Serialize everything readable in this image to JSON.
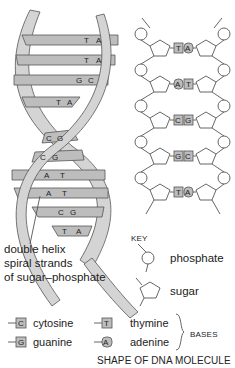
{
  "diagram": {
    "title": "SHAPE OF DNA MOLECULE",
    "helix": {
      "caption_lines": [
        "double helix",
        "spiral strands",
        "of sugar–phosphate"
      ],
      "pairs": [
        {
          "left": "T",
          "right": "A"
        },
        {
          "left": "T",
          "right": "A"
        },
        {
          "left": "G",
          "right": "C"
        },
        {
          "left": "T",
          "right": "A"
        },
        {
          "left": "C",
          "right": "G"
        },
        {
          "left": "C",
          "right": "G"
        },
        {
          "left": "A",
          "right": "T"
        },
        {
          "left": "A",
          "right": "T"
        },
        {
          "left": "C",
          "right": "G"
        },
        {
          "left": "T",
          "right": "A"
        }
      ]
    },
    "ladder": {
      "pairs": [
        {
          "left": "T",
          "right": "A"
        },
        {
          "left": "A",
          "right": "T"
        },
        {
          "left": "C",
          "right": "G"
        },
        {
          "left": "G",
          "right": "C"
        },
        {
          "left": "T",
          "right": "A"
        }
      ]
    },
    "key": {
      "heading": "KEY",
      "phosphate": "phosphate",
      "sugar": "sugar",
      "bases_label": "BASES",
      "bases": [
        {
          "letter": "C",
          "name": "cytosine"
        },
        {
          "letter": "G",
          "name": "guanine"
        },
        {
          "letter": "T",
          "name": "thymine"
        },
        {
          "letter": "A",
          "name": "adenine"
        }
      ]
    },
    "colors": {
      "strand_fill": "#d4d4d4",
      "base_fill": "#bdbdbd",
      "outline": "#555555",
      "text": "#222222"
    }
  }
}
